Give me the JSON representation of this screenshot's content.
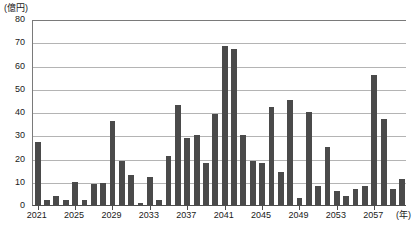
{
  "chart_data": {
    "type": "bar",
    "title": "",
    "subtitle": "",
    "xlabel": "(年)",
    "ylabel": "(億円)",
    "ylim": [
      0,
      80
    ],
    "ytick_values": [
      0,
      10,
      20,
      30,
      40,
      50,
      60,
      70,
      80
    ],
    "ytick_labels": [
      "0",
      "10",
      "20",
      "30",
      "40",
      "50",
      "60",
      "70",
      "80"
    ],
    "grid": "horizontal",
    "legend": "none",
    "bar_color": "#4a4a4a",
    "xtick_labels": [
      "2021",
      "2025",
      "2029",
      "2033",
      "2037",
      "2041",
      "2045",
      "2049",
      "2053",
      "2057"
    ],
    "xtick_categories": [
      2021,
      2025,
      2029,
      2033,
      2037,
      2041,
      2045,
      2049,
      2053,
      2057
    ],
    "categories": [
      "2021",
      "2022",
      "2023",
      "2024",
      "2025",
      "2026",
      "2027",
      "2028",
      "2029",
      "2030",
      "2031",
      "2032",
      "2033",
      "2034",
      "2035",
      "2036",
      "2037",
      "2038",
      "2039",
      "2040",
      "2041",
      "2042",
      "2043",
      "2044",
      "2045",
      "2046",
      "2047",
      "2048",
      "2049",
      "2050",
      "2051",
      "2052",
      "2053",
      "2054",
      "2055",
      "2056",
      "2057",
      "2058",
      "2059",
      "2060"
    ],
    "values": [
      27,
      2,
      4,
      2,
      10,
      2,
      9,
      9.5,
      36,
      19,
      13,
      1,
      12,
      2,
      21,
      43,
      29,
      30,
      18,
      39,
      68.5,
      67,
      30,
      19,
      18,
      42,
      14,
      45,
      3,
      40,
      8,
      25,
      6,
      4,
      7,
      8,
      56,
      37,
      7,
      11
    ],
    "series": [
      {
        "name": "金額",
        "values": [
          27,
          2,
          4,
          2,
          10,
          2,
          9,
          9.5,
          36,
          19,
          13,
          1,
          12,
          2,
          21,
          43,
          29,
          30,
          18,
          39,
          68.5,
          67,
          30,
          19,
          18,
          42,
          14,
          45,
          3,
          40,
          8,
          25,
          6,
          4,
          7,
          8,
          56,
          37,
          7,
          11
        ]
      }
    ]
  }
}
